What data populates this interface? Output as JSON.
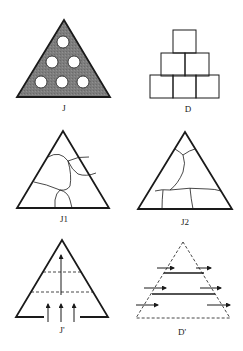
{
  "figure": {
    "panels": [
      {
        "id": "J",
        "label": "J",
        "description": "Shaded triangle with six circular holes arranged 1-2-3"
      },
      {
        "id": "D",
        "label": "D",
        "description": "Pyramid of six square blocks stacked 1-2-3"
      },
      {
        "id": "J1",
        "label": "J1",
        "description": "Triangle with irregular internal cracks (pattern 1)"
      },
      {
        "id": "J2",
        "label": "J2",
        "description": "Triangle with irregular internal cracks (pattern 2)"
      },
      {
        "id": "Jp",
        "label": "J'",
        "description": "Triangle with gap in base, dashed horizontal lines, upward arrows"
      },
      {
        "id": "Dp",
        "label": "D'",
        "description": "Dashed triangle with horizontal bars and rightward arrows"
      }
    ],
    "colors": {
      "stroke": "#1a1a1a",
      "shade": "#7a7a7a",
      "background": "#ffffff"
    }
  }
}
